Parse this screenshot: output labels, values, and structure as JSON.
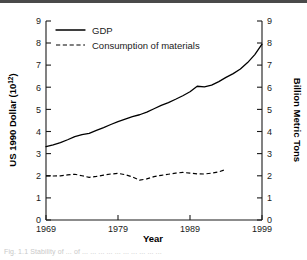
{
  "figure": {
    "background_color": "#ffffff",
    "ink_color": "#000000",
    "top_rule_color": "#4a4a4a",
    "caption_partial": "Fig. 1.1 Stability of ... of ... ... ... ... ... ... ... ... ... ..."
  },
  "chart_data": {
    "type": "line",
    "title": "",
    "xlabel": "Year",
    "ylabel": "US 1990 Dollar (10",
    "ylabel_exponent": "12",
    "ylabel_close": ")",
    "y2label": "Billion Metric Tons",
    "xlim": [
      1969,
      1999
    ],
    "ylim": [
      0,
      9
    ],
    "y2lim": [
      0,
      9
    ],
    "grid": false,
    "legend_position": "top-left-inside",
    "x_ticks": [
      1969,
      1979,
      1989,
      1999
    ],
    "x_tick_labels": [
      "1969",
      "1979",
      "1989",
      "1999"
    ],
    "y_ticks": [
      0,
      1,
      2,
      3,
      4,
      5,
      6,
      7,
      8,
      9
    ],
    "y_tick_labels": [
      "0",
      "1",
      "2",
      "3",
      "4",
      "5",
      "6",
      "7",
      "8",
      "9"
    ],
    "y2_ticks": [
      0,
      1,
      2,
      3,
      4,
      5,
      6,
      7,
      8,
      9
    ],
    "y2_tick_labels": [
      "0",
      "1",
      "2",
      "3",
      "4",
      "5",
      "6",
      "7",
      "8",
      "9"
    ],
    "series": [
      {
        "name": "GDP",
        "style": "solid",
        "axis": "left",
        "units": "US 1990 Dollar (10^12)",
        "x": [
          1969,
          1970,
          1971,
          1972,
          1973,
          1974,
          1975,
          1976,
          1977,
          1978,
          1979,
          1980,
          1981,
          1982,
          1983,
          1984,
          1985,
          1986,
          1987,
          1988,
          1989,
          1990,
          1991,
          1992,
          1993,
          1994,
          1995,
          1996,
          1997,
          1998,
          1999
        ],
        "values": [
          3.32,
          3.4,
          3.5,
          3.63,
          3.77,
          3.86,
          3.92,
          4.05,
          4.18,
          4.32,
          4.45,
          4.56,
          4.67,
          4.76,
          4.88,
          5.03,
          5.18,
          5.31,
          5.46,
          5.62,
          5.8,
          6.05,
          6.02,
          6.1,
          6.26,
          6.45,
          6.62,
          6.83,
          7.12,
          7.48,
          7.95
        ]
      },
      {
        "name": "Consumption of materials",
        "style": "dashed",
        "axis": "right",
        "units": "Billion Metric Tons",
        "x": [
          1969,
          1970,
          1971,
          1972,
          1973,
          1974,
          1975,
          1976,
          1977,
          1978,
          1979,
          1980,
          1981,
          1982,
          1983,
          1984,
          1985,
          1986,
          1987,
          1988,
          1989,
          1990,
          1991,
          1992,
          1993,
          1994
        ],
        "values": [
          2.0,
          1.99,
          2.0,
          2.04,
          2.07,
          2.0,
          1.93,
          1.97,
          2.03,
          2.08,
          2.11,
          2.05,
          1.95,
          1.8,
          1.86,
          1.96,
          2.02,
          2.07,
          2.12,
          2.15,
          2.12,
          2.09,
          2.08,
          2.12,
          2.18,
          2.29
        ]
      }
    ]
  },
  "legend": {
    "items": [
      {
        "label": "GDP",
        "style": "solid"
      },
      {
        "label": "Consumption of materials",
        "style": "dashed"
      }
    ]
  }
}
